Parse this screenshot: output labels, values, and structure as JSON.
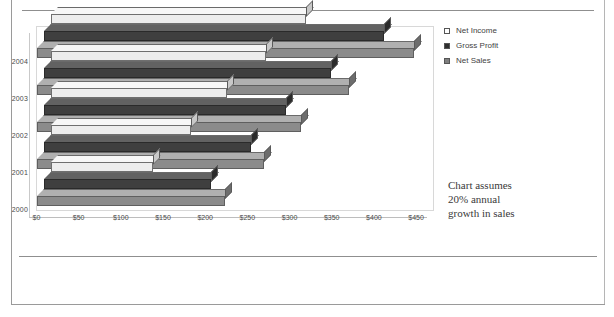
{
  "chart_data": {
    "type": "bar",
    "orientation": "horizontal",
    "style": "3d-clustered-bar",
    "title": "",
    "xlabel": "",
    "ylabel": "",
    "categories": [
      "2004",
      "2003",
      "2002",
      "2001",
      "2000"
    ],
    "series": [
      {
        "name": "Net Income",
        "color": "#ededed",
        "values": [
          303,
          255,
          209,
          167,
          122
        ]
      },
      {
        "name": "Gross Profit",
        "color": "#3f3f3f",
        "values": [
          404,
          341,
          288,
          246,
          199
        ]
      },
      {
        "name": "Net Sales",
        "color": "#8b8b8b",
        "values": [
          448,
          371,
          314,
          270,
          223
        ]
      }
    ],
    "xticks": [
      0,
      50,
      100,
      150,
      200,
      250,
      300,
      350,
      400,
      450
    ],
    "xtick_labels": [
      "$0",
      "$50",
      "$100",
      "$150",
      "$200",
      "$250",
      "$300",
      "$350",
      "$400",
      "$450"
    ],
    "xlim": [
      0,
      465
    ],
    "grid": false,
    "legend_position": "right-top",
    "legend_entries": [
      "Net Income",
      "Gross Profit",
      "Net Sales"
    ],
    "annotation": "Chart assumes 20% annual growth in sales",
    "annotation_lines": [
      "Chart assumes",
      "20% annual",
      "growth in sales"
    ]
  },
  "legend": {
    "items": [
      {
        "label": "Net Income",
        "swatch": "#ffffff"
      },
      {
        "label": "Gross Profit",
        "swatch": "#2f2f2f"
      },
      {
        "label": "Net Sales",
        "swatch": "#7f7f7f"
      }
    ]
  },
  "annotation": {
    "line1": "Chart assumes",
    "line2": "20% annual",
    "line3": "growth in sales"
  },
  "axis": {
    "years": [
      "2004",
      "2003",
      "2002",
      "2001",
      "2000"
    ],
    "ticks": [
      "$0",
      "$50",
      "$100",
      "$150",
      "$200",
      "$250",
      "$300",
      "$350",
      "$400",
      "$450"
    ]
  }
}
